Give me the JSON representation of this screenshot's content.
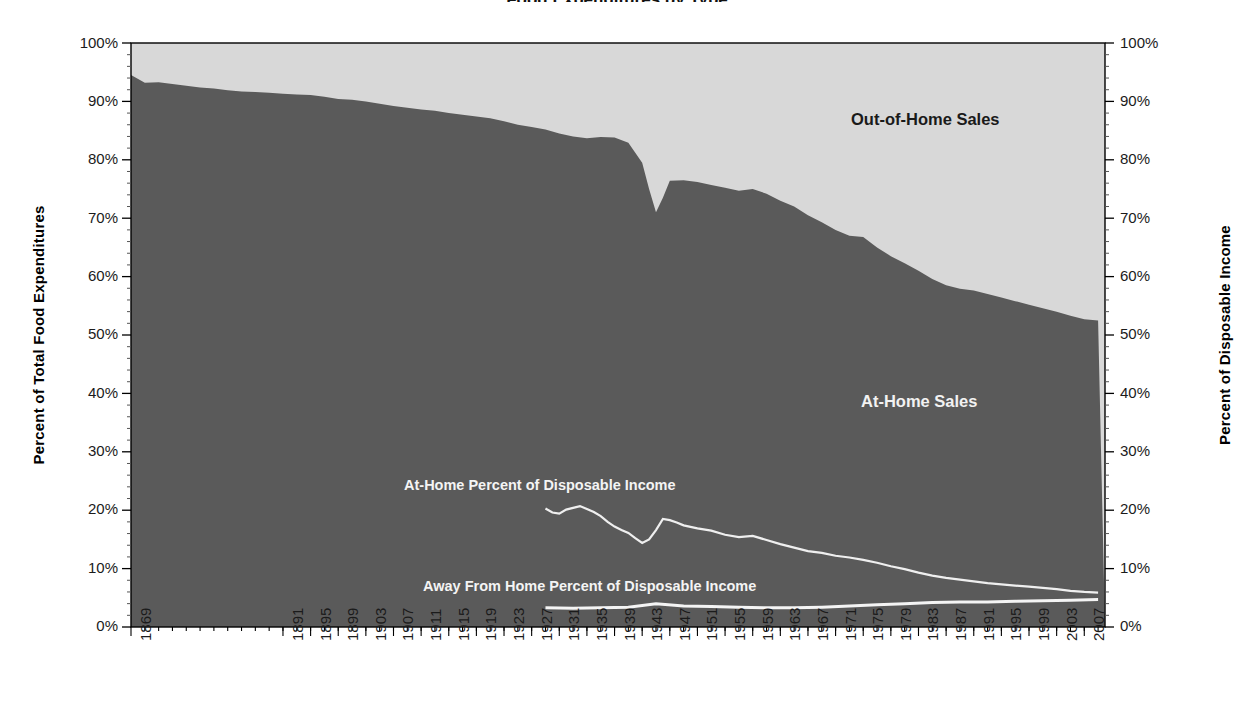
{
  "figure": {
    "clipped_title": "Food Expenditures by Type",
    "background_color": "#ffffff",
    "plot_border_color": "#000000"
  },
  "axes": {
    "left": {
      "title": "Percent of Total Food Expenditures",
      "ticks": [
        "100%",
        "90%",
        "80%",
        "70%",
        "60%",
        "50%",
        "40%",
        "30%",
        "20%",
        "10%",
        "0%"
      ]
    },
    "right": {
      "title": "Percent of Disposable Income",
      "ticks": [
        "100%",
        "90%",
        "80%",
        "70%",
        "60%",
        "50%",
        "40%",
        "30%",
        "20%",
        "10%",
        "0%"
      ]
    },
    "bottom": {
      "ticks": [
        "1869",
        "1891",
        "1895",
        "1899",
        "1903",
        "1907",
        "1911",
        "1915",
        "1919",
        "1923",
        "1927",
        "1931",
        "1935",
        "1939",
        "1943",
        "1947",
        "1951",
        "1955",
        "1959",
        "1963",
        "1967",
        "1971",
        "1975",
        "1979",
        "1983",
        "1987",
        "1991",
        "1995",
        "1999",
        "2003",
        "2007"
      ]
    }
  },
  "annotations": {
    "out_of_home_sales": "Out-of-Home Sales",
    "at_home_sales": "At-Home Sales",
    "at_home_disposable": "At-Home Percent of Disposable Income",
    "away_from_home_disposable": "Away From Home Percent of Disposable Income"
  },
  "colors": {
    "at_home_fill": "#5a5a5a",
    "out_of_home_fill": "#d8d8d8",
    "line_light": "#efefef",
    "axis": "#000000"
  },
  "chart_data": {
    "type": "area",
    "title": "Food Expenditures by Type",
    "xlabel": "",
    "ylabel": "Percent of Total Food Expenditures",
    "y2label": "Percent of Disposable Income",
    "ylim": [
      0,
      100
    ],
    "y2lim": [
      0,
      100
    ],
    "grid": false,
    "legend": "in-plot annotations",
    "x_tick_labels": [
      "1869",
      "1891",
      "1895",
      "1899",
      "1903",
      "1907",
      "1911",
      "1915",
      "1919",
      "1923",
      "1927",
      "1931",
      "1935",
      "1939",
      "1943",
      "1947",
      "1951",
      "1955",
      "1959",
      "1963",
      "1967",
      "1971",
      "1975",
      "1979",
      "1983",
      "1987",
      "1991",
      "1995",
      "1999",
      "2003",
      "2007"
    ],
    "series": [
      {
        "name": "At-Home Sales",
        "kind": "stacked-area",
        "axis": "left",
        "units": "percent of total food expenditures",
        "x": [
          1869,
          1871,
          1873,
          1875,
          1877,
          1879,
          1881,
          1883,
          1885,
          1887,
          1889,
          1891,
          1893,
          1895,
          1897,
          1899,
          1901,
          1903,
          1905,
          1907,
          1909,
          1911,
          1913,
          1915,
          1917,
          1919,
          1921,
          1923,
          1925,
          1927,
          1929,
          1931,
          1933,
          1935,
          1937,
          1939,
          1941,
          1943,
          1944,
          1945,
          1946,
          1947,
          1949,
          1951,
          1953,
          1955,
          1957,
          1959,
          1961,
          1963,
          1965,
          1967,
          1969,
          1971,
          1973,
          1975,
          1977,
          1979,
          1981,
          1983,
          1985,
          1987,
          1989,
          1991,
          1993,
          1995,
          1997,
          1999,
          2001,
          2003,
          2005,
          2007,
          2009
        ],
        "values": [
          94.5,
          93.2,
          93.3,
          93.0,
          92.7,
          92.4,
          92.2,
          91.9,
          91.7,
          91.6,
          91.5,
          91.3,
          91.2,
          91.1,
          90.8,
          90.4,
          90.3,
          90.0,
          89.6,
          89.2,
          88.9,
          88.6,
          88.4,
          88.0,
          87.7,
          87.4,
          87.1,
          86.6,
          86.0,
          85.6,
          85.2,
          84.5,
          84.0,
          83.7,
          83.9,
          83.8,
          82.9,
          79.5,
          75.0,
          71.0,
          73.5,
          76.4,
          76.5,
          76.2,
          75.7,
          75.2,
          74.7,
          75.0,
          74.2,
          73.0,
          72.0,
          70.5,
          69.3,
          68.0,
          67.0,
          66.8,
          65.0,
          63.5,
          62.3,
          61.0,
          59.6,
          58.5,
          57.9,
          57.6,
          57.0,
          56.4,
          55.8,
          55.2,
          54.6,
          54.0,
          53.3,
          52.7,
          52.5
        ]
      },
      {
        "name": "Out-of-Home Sales",
        "kind": "stacked-area",
        "axis": "left",
        "units": "percent of total food expenditures",
        "note": "remainder to 100% of the At-Home Sales series",
        "values_start": 5.5,
        "values_end": 47.5
      },
      {
        "name": "At-Home Percent of Disposable Income",
        "kind": "line",
        "axis": "right",
        "units": "percent of disposable income",
        "x": [
          1929,
          1930,
          1931,
          1932,
          1933,
          1934,
          1935,
          1936,
          1937,
          1938,
          1939,
          1940,
          1941,
          1942,
          1943,
          1944,
          1945,
          1946,
          1947,
          1948,
          1949,
          1951,
          1953,
          1955,
          1957,
          1959,
          1961,
          1963,
          1965,
          1967,
          1969,
          1971,
          1973,
          1975,
          1977,
          1979,
          1981,
          1983,
          1985,
          1987,
          1989,
          1991,
          1993,
          1995,
          1997,
          1999,
          2001,
          2003,
          2005,
          2007,
          2009
        ],
        "values": [
          20.3,
          19.6,
          19.4,
          20.1,
          20.4,
          20.7,
          20.2,
          19.7,
          19.0,
          18.0,
          17.2,
          16.6,
          16.1,
          15.2,
          14.4,
          15.0,
          16.6,
          18.5,
          18.3,
          17.9,
          17.4,
          16.9,
          16.5,
          15.8,
          15.4,
          15.6,
          14.9,
          14.2,
          13.6,
          13.0,
          12.7,
          12.2,
          11.9,
          11.5,
          11.0,
          10.4,
          9.9,
          9.3,
          8.8,
          8.4,
          8.1,
          7.8,
          7.5,
          7.3,
          7.1,
          6.9,
          6.7,
          6.5,
          6.2,
          6.0,
          5.9
        ]
      },
      {
        "name": "Away From Home Percent of Disposable Income",
        "kind": "line",
        "axis": "right",
        "units": "percent of disposable income",
        "x": [
          1929,
          1933,
          1937,
          1941,
          1945,
          1949,
          1953,
          1957,
          1961,
          1965,
          1969,
          1973,
          1977,
          1981,
          1985,
          1989,
          1993,
          1997,
          2001,
          2005,
          2009
        ],
        "values": [
          3.3,
          3.2,
          3.3,
          3.4,
          4.0,
          3.6,
          3.5,
          3.4,
          3.3,
          3.3,
          3.4,
          3.6,
          3.8,
          4.0,
          4.2,
          4.3,
          4.3,
          4.4,
          4.5,
          4.6,
          4.7
        ]
      }
    ]
  }
}
